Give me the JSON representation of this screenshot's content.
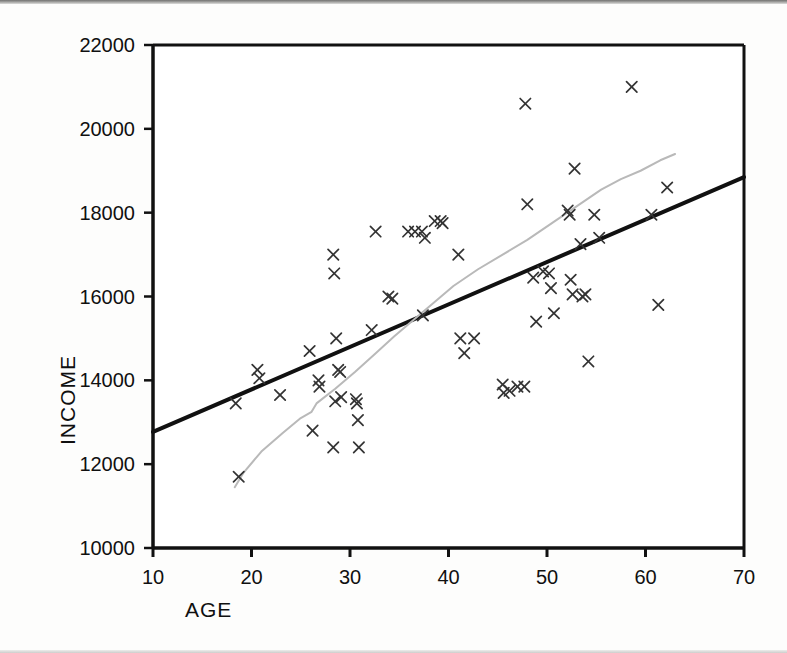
{
  "chart_data": {
    "type": "scatter",
    "title": "",
    "xlabel": "AGE",
    "ylabel": "INCOME",
    "xlim": [
      10,
      70
    ],
    "ylim": [
      10000,
      22000
    ],
    "xticks": [
      10,
      20,
      30,
      40,
      50,
      60,
      70
    ],
    "yticks": [
      10000,
      12000,
      14000,
      16000,
      18000,
      20000,
      22000
    ],
    "xtick_labels": [
      "10",
      "20",
      "30",
      "40",
      "50",
      "60",
      "70"
    ],
    "ytick_labels": [
      "10000",
      "12000",
      "14000",
      "16000",
      "18000",
      "20000",
      "22000"
    ],
    "grid": false,
    "legend": null,
    "marker": "x",
    "marker_color": "#333333",
    "points": [
      [
        18.7,
        11700
      ],
      [
        18.4,
        13450
      ],
      [
        20.6,
        14250
      ],
      [
        20.8,
        14050
      ],
      [
        22.9,
        13650
      ],
      [
        25.9,
        14700
      ],
      [
        26.2,
        12800
      ],
      [
        26.8,
        14000
      ],
      [
        26.9,
        13850
      ],
      [
        28.3,
        17000
      ],
      [
        28.4,
        16550
      ],
      [
        28.6,
        15000
      ],
      [
        28.8,
        14250
      ],
      [
        29.0,
        14200
      ],
      [
        29.1,
        13600
      ],
      [
        28.5,
        13500
      ],
      [
        28.3,
        12400
      ],
      [
        30.6,
        13550
      ],
      [
        30.7,
        13450
      ],
      [
        30.8,
        13050
      ],
      [
        30.9,
        12400
      ],
      [
        32.2,
        15200
      ],
      [
        32.6,
        17550
      ],
      [
        33.9,
        16000
      ],
      [
        34.3,
        15950
      ],
      [
        35.9,
        17550
      ],
      [
        36.6,
        17550
      ],
      [
        37.3,
        17550
      ],
      [
        37.6,
        17400
      ],
      [
        37.4,
        15550
      ],
      [
        39.2,
        17800
      ],
      [
        39.4,
        17750
      ],
      [
        38.6,
        17800
      ],
      [
        41.0,
        17000
      ],
      [
        41.2,
        15000
      ],
      [
        41.6,
        14650
      ],
      [
        42.6,
        15000
      ],
      [
        45.5,
        13900
      ],
      [
        45.6,
        13700
      ],
      [
        46.2,
        13750
      ],
      [
        47.0,
        13850
      ],
      [
        47.7,
        13850
      ],
      [
        47.8,
        20600
      ],
      [
        48.0,
        18200
      ],
      [
        48.6,
        16450
      ],
      [
        48.9,
        15400
      ],
      [
        49.6,
        16600
      ],
      [
        50.2,
        16550
      ],
      [
        50.4,
        16200
      ],
      [
        50.7,
        15600
      ],
      [
        52.1,
        18050
      ],
      [
        52.3,
        17950
      ],
      [
        52.4,
        16400
      ],
      [
        52.6,
        16050
      ],
      [
        52.8,
        19050
      ],
      [
        53.4,
        17250
      ],
      [
        53.6,
        16000
      ],
      [
        53.9,
        16050
      ],
      [
        54.2,
        14450
      ],
      [
        54.8,
        17950
      ],
      [
        55.3,
        17400
      ],
      [
        58.6,
        21000
      ],
      [
        60.6,
        17950
      ],
      [
        61.3,
        15800
      ],
      [
        62.2,
        18600
      ]
    ],
    "fit_lines": [
      {
        "name": "linear-regression-line",
        "style": "solid-thick-black",
        "color": "#111111",
        "width": 4,
        "points": [
          [
            10,
            12770
          ],
          [
            70,
            18850
          ]
        ]
      },
      {
        "name": "smoothed-lowess-curve",
        "style": "thin-gray",
        "color": "#b9b9b9",
        "width": 2,
        "points": [
          [
            18.3,
            11450
          ],
          [
            19.2,
            11800
          ],
          [
            21.0,
            12300
          ],
          [
            23.2,
            12750
          ],
          [
            25.0,
            13100
          ],
          [
            26.1,
            13250
          ],
          [
            26.6,
            13450
          ],
          [
            28.5,
            13800
          ],
          [
            30.5,
            14200
          ],
          [
            32.5,
            14620
          ],
          [
            34.5,
            15050
          ],
          [
            36.5,
            15450
          ],
          [
            38.5,
            15850
          ],
          [
            40.5,
            16250
          ],
          [
            43.0,
            16650
          ],
          [
            45.5,
            17000
          ],
          [
            48.0,
            17350
          ],
          [
            50.5,
            17750
          ],
          [
            53.0,
            18150
          ],
          [
            55.5,
            18550
          ],
          [
            57.5,
            18800
          ],
          [
            59.5,
            19000
          ],
          [
            61.5,
            19250
          ],
          [
            63.0,
            19400
          ]
        ]
      }
    ]
  },
  "axes": {
    "frame_color": "#111111",
    "background": "#ffffff"
  }
}
